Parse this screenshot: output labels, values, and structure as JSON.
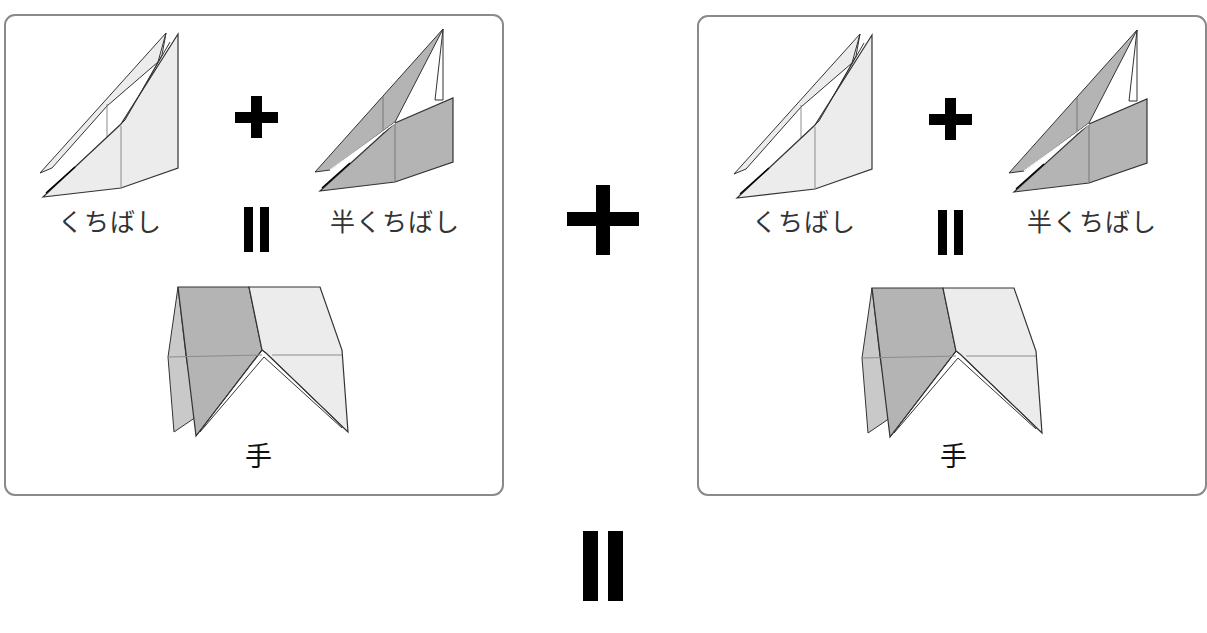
{
  "panels": [
    {
      "id": "left",
      "labels": {
        "beak": "くちばし",
        "half_beak": "半くちばし",
        "hand": "手"
      },
      "operators": {
        "plus": "+",
        "equals": "="
      }
    },
    {
      "id": "right",
      "labels": {
        "beak": "くちばし",
        "half_beak": "半くちばし",
        "hand": "手"
      },
      "operators": {
        "plus": "+",
        "equals": "="
      }
    }
  ],
  "operators": {
    "center_plus": "+",
    "bottom_equals": "="
  },
  "colors": {
    "light_paper": "#ececec",
    "dark_paper": "#b4b4b4",
    "outline": "#333333",
    "crease": "#8c8c8c",
    "panel_border": "#8a8a8a",
    "symbol": "#000000"
  }
}
